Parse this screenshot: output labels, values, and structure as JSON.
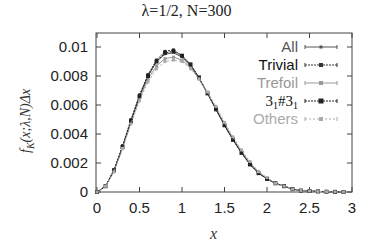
{
  "chart_data": {
    "type": "line",
    "title": "λ=1/2, N=300",
    "xlabel": "x",
    "ylabel": "f_K(x;λ,N)Δx",
    "xlim": [
      0,
      3
    ],
    "ylim": [
      0,
      0.011
    ],
    "xticks": [
      "0",
      "0.5",
      "1",
      "1.5",
      "2",
      "2.5",
      "3"
    ],
    "yticks": [
      "0",
      "0.002",
      "0.004",
      "0.006",
      "0.008",
      "0.01"
    ],
    "legend_position": "upper right",
    "x": [
      0,
      0.1,
      0.2,
      0.3,
      0.4,
      0.5,
      0.6,
      0.7,
      0.8,
      0.9,
      1.0,
      1.1,
      1.2,
      1.3,
      1.4,
      1.5,
      1.6,
      1.7,
      1.8,
      1.9,
      2.0,
      2.1,
      2.2,
      2.3,
      2.4,
      2.5,
      2.6,
      2.7,
      2.8,
      2.9
    ],
    "series": [
      {
        "name": "All",
        "color": "#555555",
        "values": [
          0,
          0.0004,
          0.0015,
          0.0031,
          0.0049,
          0.0066,
          0.008,
          0.009,
          0.0095,
          0.0096,
          0.0093,
          0.0087,
          0.0078,
          0.0068,
          0.0057,
          0.0046,
          0.0036,
          0.0027,
          0.0019,
          0.0013,
          0.0009,
          0.0006,
          0.0004,
          0.0002,
          0.0001,
          7e-05,
          4e-05,
          2e-05,
          1e-05,
          0
        ]
      },
      {
        "name": "Trivial",
        "color": "#333333",
        "values": [
          0,
          0.0004,
          0.0015,
          0.0032,
          0.005,
          0.0067,
          0.0081,
          0.0091,
          0.0097,
          0.0098,
          0.0094,
          0.0088,
          0.0079,
          0.0068,
          0.0057,
          0.0046,
          0.0036,
          0.0027,
          0.0019,
          0.0013,
          0.0009,
          0.0006,
          0.0004,
          0.0002,
          0.0001,
          7e-05,
          4e-05,
          2e-05,
          1e-05,
          0
        ]
      },
      {
        "name": "Trefoil",
        "color": "#999999",
        "values": [
          0,
          0.0004,
          0.0014,
          0.003,
          0.0048,
          0.0064,
          0.0078,
          0.0087,
          0.0092,
          0.0093,
          0.0091,
          0.0086,
          0.0078,
          0.0068,
          0.0058,
          0.0047,
          0.0037,
          0.0028,
          0.002,
          0.0014,
          0.0009,
          0.0006,
          0.0004,
          0.0002,
          0.0001,
          7e-05,
          4e-05,
          2e-05,
          1e-05,
          0
        ]
      },
      {
        "name": "3_1#3_1",
        "color": "#222222",
        "values": [
          0,
          0.0004,
          0.0015,
          0.0031,
          0.0049,
          0.0066,
          0.008,
          0.009,
          0.0096,
          0.0097,
          0.0094,
          0.0088,
          0.0079,
          0.0068,
          0.0057,
          0.0046,
          0.0036,
          0.0027,
          0.0019,
          0.0013,
          0.0009,
          0.0006,
          0.0004,
          0.0002,
          0.0001,
          7e-05,
          4e-05,
          2e-05,
          1e-05,
          0
        ]
      },
      {
        "name": "Others",
        "color": "#aaaaaa",
        "values": [
          0,
          0.0004,
          0.0014,
          0.003,
          0.0047,
          0.0063,
          0.0076,
          0.0085,
          0.009,
          0.0091,
          0.009,
          0.0085,
          0.0078,
          0.0069,
          0.0059,
          0.0048,
          0.0038,
          0.0029,
          0.0021,
          0.0014,
          0.001,
          0.0006,
          0.0004,
          0.0002,
          0.0001,
          7e-05,
          4e-05,
          2e-05,
          1e-05,
          0
        ]
      }
    ]
  },
  "legend": {
    "all": "All",
    "trivial": "Trivial",
    "trefoil": "Trefoil",
    "composite_main": "3",
    "composite_sub": "1",
    "composite_hash": "#3",
    "composite_sub2": "1",
    "others": "Others"
  }
}
